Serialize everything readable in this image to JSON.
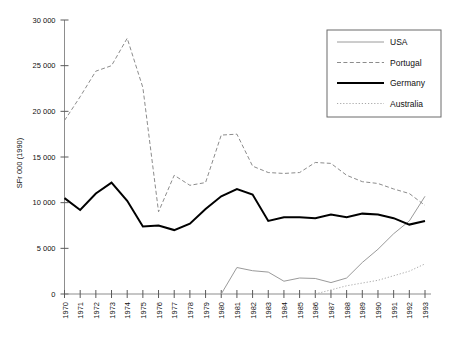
{
  "chart_data": {
    "type": "line",
    "title": "",
    "subtitle": "",
    "xlabel": "",
    "ylabel": "SFr 000 (1990)",
    "ylim": [
      0,
      30000
    ],
    "xlim": [
      1970,
      1993
    ],
    "ytick_labels": [
      "0",
      "5 000",
      "10 000",
      "15 000",
      "20 000",
      "25 000",
      "30 000"
    ],
    "ytick_values": [
      0,
      5000,
      10000,
      15000,
      20000,
      25000,
      30000
    ],
    "grid": false,
    "legend_position": "top-right",
    "categories": [
      1970,
      1971,
      1972,
      1973,
      1974,
      1975,
      1976,
      1977,
      1978,
      1979,
      1980,
      1981,
      1982,
      1983,
      1984,
      1985,
      1986,
      1987,
      1988,
      1989,
      1990,
      1991,
      1992,
      1993
    ],
    "xtick_labels": [
      "1970",
      "1971",
      "1972",
      "1973",
      "1974",
      "1975",
      "1976",
      "1977",
      "1978",
      "1979",
      "1980",
      "1981",
      "1982",
      "1983",
      "1984",
      "1985",
      "1986",
      "1987",
      "1988",
      "1989",
      "1990",
      "1991",
      "1992",
      "1993"
    ],
    "series": [
      {
        "name": "USA",
        "style": "solid-thin",
        "color": "#9a9a9a",
        "width": 1,
        "values": [
          null,
          null,
          null,
          null,
          null,
          null,
          null,
          null,
          null,
          null,
          0,
          2900,
          2550,
          2400,
          1400,
          1750,
          1700,
          1250,
          1750,
          3450,
          4900,
          6600,
          8000,
          10700
        ]
      },
      {
        "name": "Portugal",
        "style": "dashed",
        "color": "#8c8c8c",
        "width": 1,
        "values": [
          19000,
          21600,
          24400,
          25000,
          28000,
          22600,
          9000,
          13000,
          11900,
          12200,
          17400,
          17500,
          14000,
          13300,
          13200,
          13300,
          14400,
          14300,
          13000,
          12300,
          12100,
          11500,
          11000,
          9700
        ]
      },
      {
        "name": "Germany",
        "style": "solid-thick",
        "color": "#000000",
        "width": 2,
        "values": [
          10500,
          9200,
          11000,
          12200,
          10200,
          7400,
          7500,
          7000,
          7700,
          9300,
          10700,
          11500,
          10900,
          8000,
          8400,
          8400,
          8300,
          8700,
          8400,
          8800,
          8700,
          8300,
          7600,
          8000
        ]
      },
      {
        "name": "Australia",
        "style": "dotted",
        "color": "#a8a8a8",
        "width": 1,
        "values": [
          null,
          null,
          null,
          null,
          null,
          null,
          null,
          null,
          null,
          null,
          null,
          null,
          null,
          null,
          null,
          null,
          0,
          450,
          900,
          1200,
          1500,
          2000,
          2500,
          3300
        ]
      }
    ]
  },
  "legend": {
    "items": [
      {
        "label": "USA"
      },
      {
        "label": "Portugal"
      },
      {
        "label": "Germany"
      },
      {
        "label": "Australia"
      }
    ]
  }
}
